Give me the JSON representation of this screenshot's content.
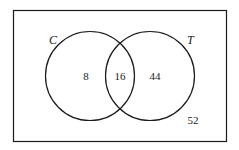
{
  "diagram": {
    "type": "venn",
    "universe": {
      "outside_count": "52"
    },
    "sets": [
      {
        "label": "C",
        "only_count": "8"
      },
      {
        "label": "T",
        "only_count": "44"
      }
    ],
    "intersection_count": "16",
    "colors": {
      "stroke": "#1a1a1a",
      "background": "#ffffff"
    }
  }
}
